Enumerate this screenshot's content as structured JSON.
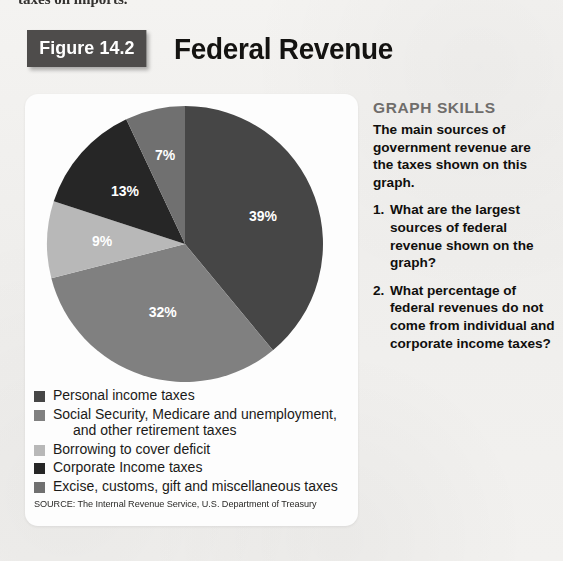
{
  "page": {
    "background_color": "#f1f0ee",
    "cutoff_text_top": "taxes on imports."
  },
  "figure": {
    "badge_label": "Figure 14.2",
    "badge_color": "#4e4c4b",
    "title": "Federal Revenue"
  },
  "chart_data": {
    "type": "pie",
    "title": "Federal Revenue",
    "source": "SOURCE: The Internal Revenue Service, U.S. Department of Treasury",
    "unit": "percent",
    "legend_position": "below",
    "start_angle_deg": 0,
    "direction": "clockwise",
    "categories": [
      "Personal income taxes",
      "Social Security, Medicare and unemployment, and other retirement taxes",
      "Borrowing to cover deficit",
      "Corporate Income taxes",
      "Excise, customs, gift and miscellaneous taxes"
    ],
    "values": [
      39,
      32,
      9,
      13,
      7
    ],
    "data_labels": [
      "39%",
      "32%",
      "9%",
      "13%",
      "7%"
    ],
    "colors": [
      "#464646",
      "#808080",
      "#b8b8b8",
      "#262626",
      "#707070"
    ]
  },
  "legend": {
    "items": [
      {
        "label": "Personal income taxes",
        "label_cont": "",
        "color": "#464646",
        "value_label": "39%"
      },
      {
        "label": "Social Security, Medicare and unemployment,",
        "label_cont": "and other retirement taxes",
        "color": "#808080",
        "value_label": "32%"
      },
      {
        "label": "Borrowing to cover deficit",
        "label_cont": "",
        "color": "#b8b8b8",
        "value_label": "9%"
      },
      {
        "label": "Corporate Income taxes",
        "label_cont": "",
        "color": "#262626",
        "value_label": "13%"
      },
      {
        "label": "Excise, customs, gift and miscellaneous taxes",
        "label_cont": "",
        "color": "#707070",
        "value_label": "7%"
      }
    ]
  },
  "skills": {
    "title": "GRAPH SKILLS",
    "title_color": "#6f6d6b",
    "intro": "The main sources of government revenue are the taxes shown on this graph.",
    "questions": [
      {
        "number": "1.",
        "text": "What are the largest sources of federal revenue shown on the graph?"
      },
      {
        "number": "2.",
        "text": "What percentage of federal revenues do not come from individual and corporate income taxes?"
      }
    ]
  }
}
